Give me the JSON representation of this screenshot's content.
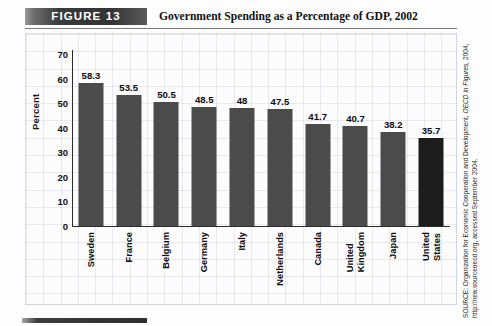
{
  "header": {
    "figure_badge": "FIGURE  13",
    "title": "Government Spending as a Percentage of GDP, 2002"
  },
  "source": {
    "prefix": "SOURCE: Organization for Economic Cooperation and Development, ",
    "italic": "OECD in Figures,",
    "suffix": " 2004, http://new.sourceoecd.org, accessed September 2004."
  },
  "chart_data": {
    "type": "bar",
    "title": "Government Spending as a Percentage of GDP, 2002",
    "xlabel": "",
    "ylabel": "Percent",
    "ylim": [
      0,
      70
    ],
    "yticks": [
      70,
      60,
      50,
      40,
      30,
      20,
      10,
      0
    ],
    "grid": true,
    "legend": null,
    "bar_color": "#4b4b4b",
    "highlight_color": "#1c1c1c",
    "categories": [
      "Sweden",
      "France",
      "Belgium",
      "Germany",
      "Italy",
      "Netherlands",
      "United Kingdom",
      "Canada",
      "Japan",
      "United States"
    ],
    "category_lines": [
      [
        "Sweden"
      ],
      [
        "France"
      ],
      [
        "Belgium"
      ],
      [
        "Germany"
      ],
      [
        "Italy"
      ],
      [
        "Netherlands"
      ],
      [
        "Canada"
      ],
      [
        "United",
        "Kingdom"
      ],
      [
        "Japan"
      ],
      [
        "United",
        "States"
      ]
    ],
    "categories_ordered": [
      "Sweden",
      "France",
      "Belgium",
      "Germany",
      "Italy",
      "Netherlands",
      "Canada",
      "United Kingdom",
      "Japan",
      "United States"
    ],
    "values": [
      58.3,
      53.5,
      50.5,
      48.5,
      48,
      47.5,
      41.7,
      40.7,
      38.2,
      35.7
    ],
    "value_labels": [
      "58.3",
      "53.5",
      "50.5",
      "48.5",
      "48",
      "47.5",
      "41.7",
      "40.7",
      "38.2",
      "35.7"
    ],
    "highlight_index": 9
  }
}
